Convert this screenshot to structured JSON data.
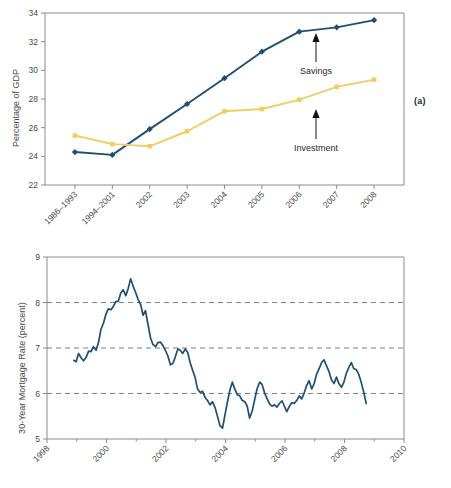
{
  "figure": {
    "panel_a_tag": "(a)",
    "panel_b_tag": "(b)"
  },
  "chart_data": [
    {
      "type": "line",
      "panel": "(a)",
      "title": "",
      "xlabel": "",
      "ylabel": "Percentage of GDP",
      "ylim": [
        22,
        34
      ],
      "yticks": [
        22,
        24,
        26,
        28,
        30,
        32,
        34
      ],
      "grid": false,
      "legend_position": "inline-annotations",
      "categories": [
        "1986–1993",
        "1994–2001",
        "2002",
        "2003",
        "2004",
        "2005",
        "2006",
        "2007",
        "2008"
      ],
      "series": [
        {
          "name": "Savings",
          "color": "#1f4f73",
          "marker": "diamond",
          "values": [
            24.3,
            24.1,
            25.9,
            27.65,
            29.45,
            31.3,
            32.7,
            33.0,
            33.5
          ]
        },
        {
          "name": "Investment",
          "color": "#f2cd64",
          "marker": "square",
          "values": [
            25.45,
            24.85,
            24.7,
            25.75,
            27.15,
            27.3,
            27.95,
            28.85,
            29.35
          ]
        }
      ],
      "annotations": [
        {
          "text": "Savings",
          "points_to_series": "Savings",
          "points_to_category": "2006"
        },
        {
          "text": "Investment",
          "points_to_series": "Investment",
          "points_to_category": "2006"
        }
      ]
    },
    {
      "type": "line",
      "panel": "(b)",
      "title": "",
      "xlabel": "",
      "ylabel": "30-Year Mortgage Rate (percent)",
      "ylim": [
        5,
        9
      ],
      "yticks": [
        5,
        6,
        7,
        8,
        9
      ],
      "xlim": [
        1998,
        2010
      ],
      "xticks": [
        1998,
        2000,
        2002,
        2004,
        2006,
        2008,
        2010
      ],
      "grid": true,
      "gridlines_at": [
        6,
        7,
        8
      ],
      "legend_position": "none",
      "series": [
        {
          "name": "30-Year Mortgage Rate",
          "color": "#1f4f73",
          "x": [
            1998.9,
            1998.98,
            1999.06,
            1999.15,
            1999.23,
            1999.31,
            1999.4,
            1999.48,
            1999.56,
            1999.65,
            1999.73,
            1999.81,
            1999.9,
            1999.98,
            2000.06,
            2000.15,
            2000.23,
            2000.31,
            2000.4,
            2000.48,
            2000.56,
            2000.65,
            2000.73,
            2000.81,
            2000.9,
            2000.98,
            2001.06,
            2001.15,
            2001.23,
            2001.31,
            2001.4,
            2001.48,
            2001.56,
            2001.65,
            2001.73,
            2001.81,
            2001.9,
            2001.98,
            2002.06,
            2002.15,
            2002.23,
            2002.31,
            2002.4,
            2002.48,
            2002.56,
            2002.65,
            2002.73,
            2002.81,
            2002.9,
            2002.98,
            2003.06,
            2003.15,
            2003.23,
            2003.31,
            2003.4,
            2003.48,
            2003.56,
            2003.65,
            2003.73,
            2003.81,
            2003.9,
            2003.98,
            2004.06,
            2004.15,
            2004.23,
            2004.31,
            2004.4,
            2004.48,
            2004.56,
            2004.65,
            2004.73,
            2004.81,
            2004.9,
            2004.98,
            2005.06,
            2005.15,
            2005.23,
            2005.31,
            2005.4,
            2005.48,
            2005.56,
            2005.65,
            2005.73,
            2005.81,
            2005.9,
            2005.98,
            2006.06,
            2006.15,
            2006.23,
            2006.31,
            2006.4,
            2006.48,
            2006.56,
            2006.65,
            2006.73,
            2006.81,
            2006.9,
            2006.98,
            2007.06,
            2007.15,
            2007.23,
            2007.31,
            2007.4,
            2007.48,
            2007.56,
            2007.65,
            2007.73,
            2007.81,
            2007.9,
            2007.98,
            2008.06,
            2008.15,
            2008.23,
            2008.31,
            2008.4,
            2008.48,
            2008.56,
            2008.65,
            2008.73
          ],
          "y": [
            6.73,
            6.7,
            6.88,
            6.78,
            6.72,
            6.79,
            6.93,
            6.92,
            7.03,
            6.95,
            7.12,
            7.4,
            7.55,
            7.74,
            7.86,
            7.84,
            7.91,
            8.02,
            8.03,
            8.21,
            8.28,
            8.15,
            8.31,
            8.52,
            8.35,
            8.22,
            8.07,
            7.95,
            7.72,
            7.82,
            7.5,
            7.22,
            7.08,
            7.03,
            7.12,
            7.13,
            7.05,
            6.95,
            6.83,
            6.63,
            6.66,
            6.8,
            6.98,
            6.95,
            6.88,
            6.98,
            6.9,
            6.68,
            6.5,
            6.35,
            6.1,
            6.02,
            6.05,
            5.92,
            5.84,
            5.75,
            5.82,
            5.69,
            5.5,
            5.3,
            5.24,
            5.52,
            5.8,
            6.08,
            6.25,
            6.1,
            5.97,
            5.95,
            5.85,
            5.82,
            5.72,
            5.46,
            5.62,
            5.86,
            6.1,
            6.25,
            6.2,
            6.02,
            5.88,
            5.77,
            5.72,
            5.75,
            5.7,
            5.78,
            5.84,
            5.72,
            5.6,
            5.72,
            5.8,
            5.78,
            5.85,
            5.95,
            5.88,
            6.02,
            6.18,
            6.28,
            6.1,
            6.22,
            6.42,
            6.55,
            6.68,
            6.74,
            6.6,
            6.48,
            6.3,
            6.22,
            6.36,
            6.22,
            6.14,
            6.25,
            6.44,
            6.58,
            6.68,
            6.55,
            6.52,
            6.42,
            6.25,
            6.02,
            5.78,
            5.9,
            5.95,
            6.05,
            6.3,
            6.48,
            6.4,
            6.2,
            6.05,
            6.15
          ]
        }
      ]
    }
  ]
}
